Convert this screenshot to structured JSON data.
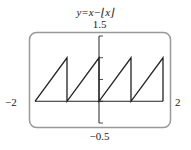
{
  "chart_data": {
    "type": "line",
    "title": "y=x−⌊x⌋",
    "function": "x - floor(x)",
    "xlabel": "",
    "ylabel": "",
    "xlim": [
      -2,
      2
    ],
    "ylim": [
      -0.5,
      1.5
    ],
    "x_tick_labels": [
      "-2",
      "2"
    ],
    "y_tick_labels": [
      "1.5",
      "-0.5"
    ],
    "y_ticks": [
      -0.5,
      0,
      0.5,
      1,
      1.5
    ],
    "grid": false,
    "legend": "none",
    "series": [
      {
        "name": "y = x - floor(x)",
        "x": [
          -2,
          -1,
          -1,
          0,
          0,
          1,
          1,
          2,
          2
        ],
        "y": [
          0,
          1,
          0,
          1,
          0,
          1,
          0,
          1,
          0
        ]
      }
    ],
    "frame": "rounded-box"
  },
  "labels": {
    "title": "y=x−⌊x⌋",
    "y_max": "1.5",
    "y_min": "−0.5",
    "x_min": "−2",
    "x_max": "2"
  },
  "colors": {
    "curve": "#222222",
    "axis": "#222222",
    "frame": "#999999"
  }
}
